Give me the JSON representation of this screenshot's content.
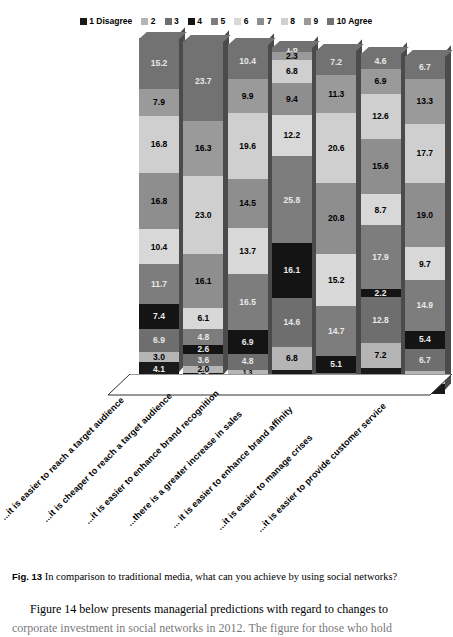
{
  "legend": {
    "items": [
      {
        "label": "1 Disagree",
        "color": "#1a1a1a"
      },
      {
        "label": "2",
        "color": "#b5b5b5"
      },
      {
        "label": "3",
        "color": "#6e6e6e"
      },
      {
        "label": "4",
        "color": "#141414"
      },
      {
        "label": "5",
        "color": "#7d7d7d"
      },
      {
        "label": "6",
        "color": "#d8d8d8"
      },
      {
        "label": "7",
        "color": "#8e8e8e"
      },
      {
        "label": "8",
        "color": "#cfcfcf"
      },
      {
        "label": "9",
        "color": "#9a9a9a"
      },
      {
        "label": "10 Agree",
        "color": "#727272"
      }
    ]
  },
  "chart_data": {
    "type": "bar",
    "subtype": "stacked-100-percent-3d",
    "title": "In comparison to traditional media, what can you achieve by using social networks?",
    "xlabel": "",
    "ylabel": "",
    "ylim": [
      0,
      100
    ],
    "grid": false,
    "legend_position": "top-center",
    "categories": [
      "...it is easier to reach a target audience",
      "...it is cheaper to reach a target audience",
      "...it is easier to enhance brand recognition",
      "...there is a greater increase in sales",
      "... it is easier to enhance brand affinity",
      "...it is easier to manage crises",
      "...it is easier to provide customer service"
    ],
    "series": [
      {
        "name": "1 Disagree",
        "color": "#1a1a1a",
        "values": [
          4.1,
          1.8,
          2.3,
          4.4,
          1.0,
          6.4,
          3.1
        ]
      },
      {
        "name": "2",
        "color": "#b5b5b5",
        "values": [
          3.0,
          2.0,
          1.3,
          6.8,
          0.0,
          7.2,
          3.6
        ]
      },
      {
        "name": "3",
        "color": "#6e6e6e",
        "values": [
          6.9,
          3.6,
          4.8,
          14.6,
          3.3,
          12.8,
          6.7
        ]
      },
      {
        "name": "4",
        "color": "#141414",
        "values": [
          7.4,
          2.6,
          6.9,
          16.1,
          5.1,
          2.2,
          5.4
        ]
      },
      {
        "name": "5",
        "color": "#7d7d7d",
        "values": [
          11.7,
          6.1,
          16.5,
          25.8,
          14.7,
          17.9,
          14.9
        ]
      },
      {
        "name": "6",
        "color": "#d8d8d8",
        "values": [
          10.4,
          4.8,
          13.7,
          12.2,
          15.2,
          8.7,
          9.7
        ]
      },
      {
        "name": "7",
        "color": "#8e8e8e",
        "values": [
          16.8,
          16.1,
          14.5,
          9.4,
          20.8,
          15.6,
          19.0
        ]
      },
      {
        "name": "8",
        "color": "#cfcfcf",
        "values": [
          16.8,
          23.0,
          19.6,
          6.8,
          20.6,
          12.6,
          17.7
        ]
      },
      {
        "name": "9",
        "color": "#9a9a9a",
        "values": [
          7.9,
          16.3,
          9.9,
          2.3,
          11.3,
          6.9,
          13.3
        ]
      },
      {
        "name": "10 Agree",
        "color": "#727272",
        "values": [
          15.2,
          23.7,
          10.4,
          1.6,
          7.2,
          4.6,
          6.7
        ]
      }
    ],
    "columns": [
      {
        "category": "...it is easier to reach a target audience",
        "stack_top_to_bottom": [
          15.2,
          7.9,
          16.8,
          16.8,
          10.4,
          11.7,
          7.4,
          6.9,
          3.0,
          4.1
        ]
      },
      {
        "category": "...it is cheaper to reach a target audience",
        "stack_top_to_bottom": [
          23.7,
          16.3,
          23.0,
          16.1,
          6.1,
          4.8,
          2.6,
          3.6,
          2.0,
          1.8
        ]
      },
      {
        "category": "...it is easier to enhance brand recognition",
        "stack_top_to_bottom": [
          10.4,
          9.9,
          19.6,
          14.5,
          13.7,
          16.5,
          6.9,
          4.8,
          1.3,
          2.3
        ]
      },
      {
        "category": "...there is a greater increase in sales",
        "stack_top_to_bottom": [
          1.6,
          2.3,
          6.8,
          9.4,
          12.2,
          25.8,
          16.1,
          14.6,
          6.8,
          4.4
        ]
      },
      {
        "category": "... it is easier to enhance brand affinity",
        "stack_top_to_bottom": [
          7.2,
          11.3,
          20.6,
          20.8,
          15.2,
          14.7,
          5.1,
          3.3,
          0.0,
          1.0
        ]
      },
      {
        "category": "...it is easier to manage crises",
        "stack_top_to_bottom": [
          4.6,
          6.9,
          12.6,
          15.6,
          8.7,
          17.9,
          2.2,
          12.8,
          7.2,
          6.4
        ]
      },
      {
        "category": "...it is easier to provide customer service",
        "stack_top_to_bottom": [
          6.7,
          13.3,
          17.7,
          19.0,
          9.7,
          14.9,
          5.4,
          6.7,
          3.6,
          3.1
        ]
      }
    ]
  },
  "caption": {
    "figure_number": "Fig. 13",
    "text": "In comparison to traditional media, what can you achieve by using social networks?"
  },
  "body": {
    "line1": "Figure 14 below presents managerial predictions with regard to changes to",
    "line2": "corporate investment in social networks in 2012. The figure for those who hold"
  }
}
